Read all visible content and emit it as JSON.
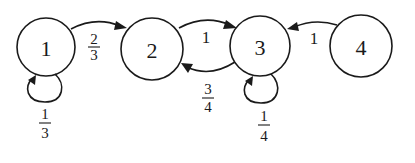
{
  "diagram": {
    "type": "markov-chain-state-transition",
    "nodes": [
      {
        "id": "1",
        "label": "1",
        "cx": 46,
        "cy": 47,
        "r": 29
      },
      {
        "id": "2",
        "label": "2",
        "cx": 152,
        "cy": 49,
        "r": 31
      },
      {
        "id": "3",
        "label": "3",
        "cx": 260,
        "cy": 46,
        "r": 30
      },
      {
        "id": "4",
        "label": "4",
        "cx": 361,
        "cy": 46,
        "r": 31
      }
    ],
    "edges": [
      {
        "from": "1",
        "to": "1",
        "kind": "self-loop",
        "label": {
          "num": "1",
          "den": "3"
        }
      },
      {
        "from": "1",
        "to": "2",
        "kind": "arc",
        "label": {
          "num": "2",
          "den": "3"
        }
      },
      {
        "from": "2",
        "to": "3",
        "kind": "arc",
        "label": {
          "text": "1"
        }
      },
      {
        "from": "3",
        "to": "2",
        "kind": "arc",
        "label": {
          "num": "3",
          "den": "4"
        }
      },
      {
        "from": "3",
        "to": "3",
        "kind": "self-loop",
        "label": {
          "num": "1",
          "den": "4"
        }
      },
      {
        "from": "4",
        "to": "3",
        "kind": "arc",
        "label": {
          "text": "1"
        }
      }
    ]
  }
}
